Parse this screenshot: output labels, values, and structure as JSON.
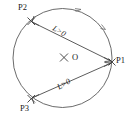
{
  "figure": {
    "type": "circle-geometry-diagram",
    "background_color": "#ffffff",
    "stroke_color": "#4a4a4a",
    "text_color": "#1a1a1a",
    "circle": {
      "center_label": "O",
      "center_marker": "×",
      "cx": 62.5,
      "cy": 58,
      "r": 49.5
    },
    "points": [
      {
        "id": "P1",
        "label": "P1",
        "x": 112,
        "y": 62,
        "marker": "×"
      },
      {
        "id": "P2",
        "label": "P2",
        "x": 31,
        "y": 21,
        "marker": "×"
      },
      {
        "id": "P3",
        "label": "P3",
        "x": 31,
        "y": 99,
        "marker": "×"
      }
    ],
    "chords": [
      {
        "id": "chord-p2-p1",
        "from": "P2",
        "to": "P1",
        "label": "L>0",
        "arrow_at": "both"
      },
      {
        "id": "chord-p3-p1",
        "from": "P3",
        "to": "P1",
        "label": "L>0",
        "arrow_at": "both"
      }
    ],
    "arc_arrows": [
      {
        "id": "arc-arrow-top",
        "x": 79,
        "y": 9
      },
      {
        "id": "arc-arrow-upper-right",
        "x": 104,
        "y": 28
      }
    ]
  }
}
